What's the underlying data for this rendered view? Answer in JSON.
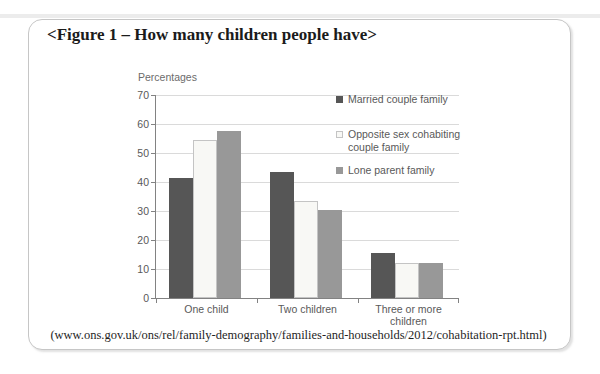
{
  "figure": {
    "title": "<Figure 1 – How many children people have>",
    "source": "(www.ons.gov.uk/ons/rel/family-demography/families-and-households/2012/cohabitation-rpt.html)"
  },
  "chart_data": {
    "type": "bar",
    "title": "",
    "axis_title": "Percentages",
    "categories": [
      "One child",
      "Two children",
      "Three or more\nchildren"
    ],
    "series": [
      {
        "name": "Married couple family",
        "color": "#565656",
        "values": [
          41.5,
          43.5,
          15.5
        ]
      },
      {
        "name": "Opposite sex cohabiting couple family",
        "color": "#f8f8f5",
        "border": "#c4c4c4",
        "values": [
          54.5,
          33.5,
          12
        ]
      },
      {
        "name": "Lone parent family",
        "color": "#989898",
        "values": [
          57.5,
          30.5,
          12
        ]
      }
    ],
    "ylim": [
      0,
      70
    ],
    "ytick_step": 10,
    "grid": true,
    "grid_color": "#dadada",
    "axis_color": "#828282",
    "legend_position": "right"
  }
}
